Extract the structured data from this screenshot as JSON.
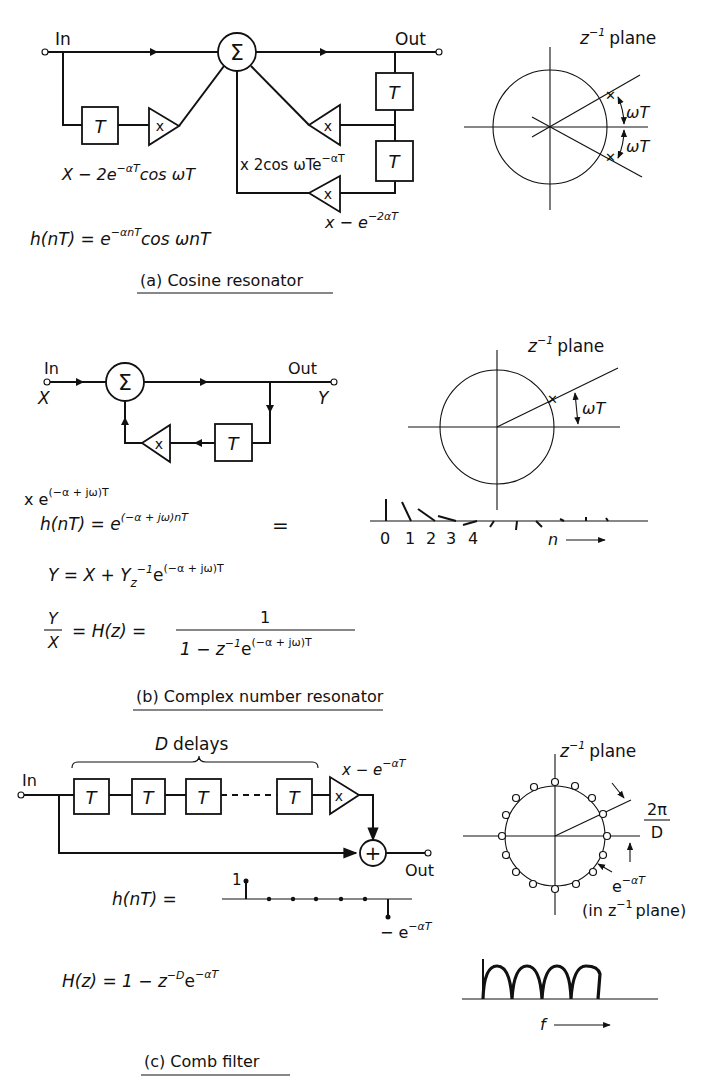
{
  "panel_a": {
    "caption": "(a) Cosine resonator",
    "in_label": "In",
    "out_label": "Out",
    "sum_symbol": "Σ",
    "delay_label": "T",
    "mult_label": "x",
    "coef_left": "X − 2e",
    "coef_left_sup": "−αT",
    "coef_left_tail": "cos ωT",
    "coef_mid": "x 2cos ωTe",
    "coef_mid_sup": "−αT",
    "coef_bottom": "x − e",
    "coef_bottom_sup": "−2αT",
    "impulse_lhs": "h(nT) = e",
    "impulse_sup": "−αnT",
    "impulse_tail": "cos ωnT",
    "plane_label": "z",
    "plane_sup": "−1",
    "plane_word": "plane",
    "angle_upper": "ωT",
    "angle_lower": "ωT"
  },
  "panel_b": {
    "caption": "(b) Complex number resonator",
    "in_label": "In",
    "in_var": "X",
    "out_label": "Out",
    "out_var": "Y",
    "sum_symbol": "Σ",
    "delay_label": "T",
    "mult_label": "x",
    "coef": "x e",
    "coef_sup": "(−α + jω)T",
    "impulse_lhs": "h(nT) = e",
    "impulse_sup": "(−α + jω)nT",
    "equals": "=",
    "eq2_lhs": "Y  =  X + Y",
    "eq2_z": "z",
    "eq2_sup1": "−1",
    "eq2_e": "e",
    "eq2_sup2": "(−α + jω)T",
    "eq3_num": "Y",
    "eq3_den": "X",
    "eq3_mid": "= H(z) =",
    "eq3_frac_num": "1",
    "eq3_frac_den": "1 − z",
    "eq3_frac_sup1": "−1",
    "eq3_frac_e": "e",
    "eq3_frac_sup2": "(−α + jω)T",
    "plane_label": "z",
    "plane_sup": "−1",
    "plane_word": "plane",
    "angle": "ωT",
    "n_ticks": [
      "0",
      "1",
      "2",
      "3",
      "4"
    ],
    "n_axis": "n"
  },
  "panel_c": {
    "caption": "(c) Comb filter",
    "in_label": "In",
    "out_label": "Out",
    "delays_label": "D delays",
    "delay_label": "T",
    "mult_label": "x",
    "sum_symbol": "+",
    "coef": "x − e",
    "coef_sup": "−αT",
    "impulse_lhs": "h(nT)  =",
    "impulse_one": "1",
    "impulse_neg": "− e",
    "impulse_neg_sup": "−αT",
    "transfer_lhs": "H(z) = 1 − z",
    "transfer_sup1": "−D",
    "transfer_e": "e",
    "transfer_sup2": "−αT",
    "plane_label": "z",
    "plane_sup": "−1",
    "plane_word": "plane",
    "angle_num": "2π",
    "angle_den": "D",
    "radius_label": "e",
    "radius_sup": "−αT",
    "radius_note": "(in z",
    "radius_note_sup": "−1",
    "radius_note_tail": "plane)",
    "freq_axis": "f"
  }
}
